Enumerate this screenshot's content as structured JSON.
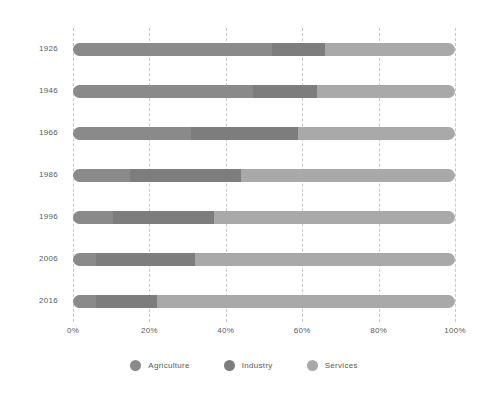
{
  "chart_data": {
    "type": "bar",
    "orientation": "horizontal",
    "stacked": true,
    "normalized": true,
    "title": "",
    "subtitle": "",
    "xlabel": "",
    "ylabel": "",
    "xlim": [
      0,
      100
    ],
    "grid": true,
    "legend_position": "bottom",
    "categories": [
      "1926",
      "1946",
      "1966",
      "1986",
      "1996",
      "2006",
      "2016"
    ],
    "xticks": [
      0,
      20,
      40,
      60,
      80,
      100
    ],
    "xticklabels": [
      "0%",
      "20%",
      "40%",
      "60%",
      "80%",
      "100%"
    ],
    "series": [
      {
        "name": "Agriculture",
        "color": "#8a8a8a",
        "values": [
          52,
          47,
          31,
          15,
          10.5,
          6,
          6
        ]
      },
      {
        "name": "Industry",
        "color": "#7d7d7d",
        "values": [
          14,
          17,
          28,
          29,
          26.5,
          26,
          16
        ]
      },
      {
        "name": "Services",
        "color": "#a9a9a9",
        "values": [
          34,
          36,
          41,
          56,
          63,
          68,
          78
        ]
      }
    ]
  },
  "colors": {
    "background": "#ffffff",
    "gridline": "#c9c9c9",
    "text": "#5a5a5a",
    "agriculture": "#8a8a8a",
    "industry": "#7d7d7d",
    "services": "#a9a9a9"
  }
}
